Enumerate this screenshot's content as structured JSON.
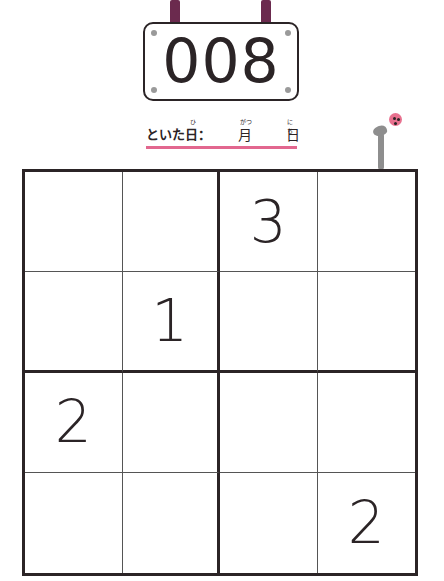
{
  "puzzle": {
    "number": "008",
    "date_label": "といた日：",
    "date_ruby": "ひ",
    "month_label": "月",
    "month_ruby": "がつ",
    "day_label": "日",
    "day_ruby": "にち"
  },
  "colors": {
    "strap": "#6b2a4e",
    "ink": "#2b2426",
    "underline": "#e2678f",
    "ladybug": "#e8718f"
  },
  "grid": {
    "size": 4,
    "rows": [
      [
        "",
        "",
        "3",
        ""
      ],
      [
        "",
        "1",
        "",
        ""
      ],
      [
        "2",
        "",
        "",
        ""
      ],
      [
        "",
        "",
        "",
        "2"
      ]
    ]
  }
}
